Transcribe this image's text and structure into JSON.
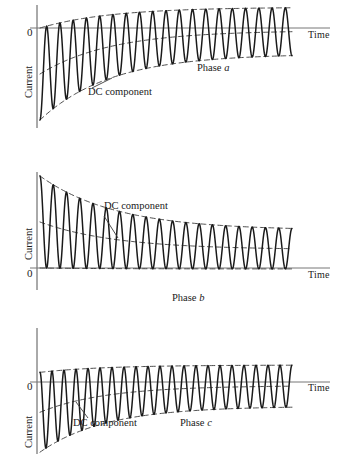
{
  "figure": {
    "title_cropped": "",
    "axis_labels": {
      "y": "Current",
      "x": "Time",
      "origin": "0"
    },
    "annotation": "DC component",
    "ink_color": "#1a1a1a",
    "axis_color": "#555555",
    "dash_color": "#3a3a3a"
  },
  "plots": [
    {
      "id": "phase-a",
      "phase_word": "Phase",
      "phase_letter": "a",
      "y_label": "Current",
      "x_label": "Time",
      "origin_label": "0",
      "dc_label": "DC component",
      "chart_data": {
        "type": "line",
        "title": "Phase a",
        "xlabel": "Time",
        "ylabel": "Current",
        "grid": false,
        "legend": "none",
        "zero_line_y": 0,
        "dc_offset_initial": -1.0,
        "dc_offset_final": -0.08,
        "ac_amplitude_initial": 1.0,
        "ac_amplitude_final": 0.52,
        "cycles": 19,
        "decay_constant": 0.28,
        "annotations": [
          "DC component",
          "Phase a"
        ]
      }
    },
    {
      "id": "phase-b",
      "phase_word": "Phase",
      "phase_letter": "b",
      "y_label": "Current",
      "x_label": "Time",
      "origin_label": "0",
      "dc_label": "DC component",
      "chart_data": {
        "type": "line",
        "title": "Phase b",
        "xlabel": "Time",
        "ylabel": "Current",
        "grid": false,
        "legend": "none",
        "zero_line_y": 0,
        "dc_offset_initial": 1.0,
        "dc_offset_final": 0.42,
        "ac_amplitude_initial": 1.0,
        "ac_amplitude_final": 0.44,
        "cycles": 19,
        "decay_constant": 0.3,
        "annotations": [
          "DC component",
          "Phase b"
        ]
      }
    },
    {
      "id": "phase-c",
      "phase_word": "Phase",
      "phase_letter": "c",
      "y_label": "Current",
      "x_label": "Time",
      "origin_label": "0",
      "dc_label": "DC component",
      "chart_data": {
        "type": "line",
        "title": "Phase c",
        "xlabel": "Time",
        "ylabel": "Current",
        "grid": false,
        "legend": "none",
        "zero_line_y": 0,
        "dc_offset_initial": -0.72,
        "dc_offset_final": -0.1,
        "ac_amplitude_initial": 0.95,
        "ac_amplitude_final": 0.5,
        "cycles": 21,
        "decay_constant": 0.26,
        "annotations": [
          "DC component",
          "Phase c"
        ]
      }
    }
  ]
}
